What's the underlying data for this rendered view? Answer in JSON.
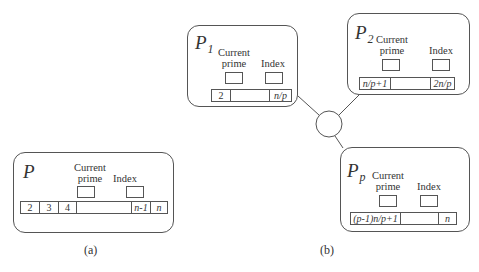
{
  "figure_a": {
    "caption": "(a)",
    "process": {
      "name": "P",
      "subscript": "",
      "current_prime_label": [
        "Current",
        "prime"
      ],
      "index_label": "Index",
      "array_cells": [
        "2",
        "3",
        "4",
        "",
        "n-1",
        "n"
      ]
    }
  },
  "figure_b": {
    "caption": "(b)",
    "processes": [
      {
        "name": "P",
        "subscript": "1",
        "current_prime_label": [
          "Current",
          "prime"
        ],
        "index_label": "Index",
        "array_cells": [
          "2",
          "",
          "n/p"
        ]
      },
      {
        "name": "P",
        "subscript": "2",
        "current_prime_label": [
          "Current",
          "prime"
        ],
        "index_label": "Index",
        "array_cells": [
          "n/p+1",
          "",
          "2n/p"
        ]
      },
      {
        "name": "P",
        "subscript": "p",
        "current_prime_label": [
          "Current",
          "prime"
        ],
        "index_label": "Index",
        "array_cells": [
          "(p-1)n/p+1",
          "",
          "n"
        ]
      }
    ],
    "interconnect": "network-hub"
  }
}
